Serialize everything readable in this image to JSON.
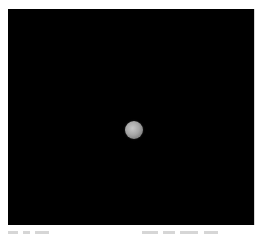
{
  "viewport": {
    "background": "#000000",
    "object": {
      "type": "sphere",
      "color": "#a6a6a6"
    }
  },
  "caption": {
    "left_text": "",
    "right_text": "",
    "note": "truncated"
  }
}
